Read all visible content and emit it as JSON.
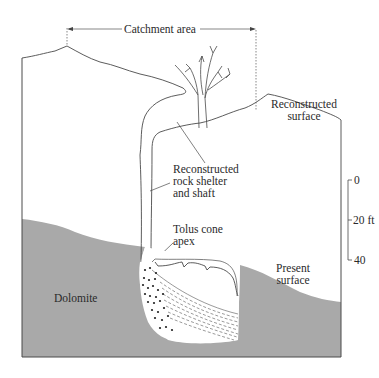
{
  "figure": {
    "type": "geologic cross-section diagram",
    "colors": {
      "dolomite_fill": "#a9a9a9",
      "line": "#4a4a4a",
      "background": "#ffffff",
      "text": "#2a2a2a"
    }
  },
  "labels": {
    "catchment_area": "Catchment area",
    "reconstructed_surface_line1": "Reconstructed",
    "reconstructed_surface_line2": "surface",
    "rock_shelter_line1": "Reconstructed",
    "rock_shelter_line2": "rock shelter",
    "rock_shelter_line3": "and shaft",
    "talus_line1": "Tolus cone",
    "talus_line2": "apex",
    "present_surface_line1": "Present",
    "present_surface_line2": "surface",
    "dolomite": "Dolomite"
  },
  "scale_bar": {
    "ticks": [
      "0",
      "20 ft",
      "40"
    ]
  }
}
